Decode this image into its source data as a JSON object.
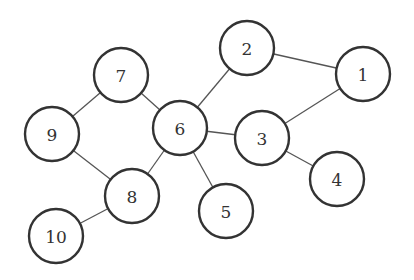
{
  "graph": {
    "node_radius": 27,
    "colors": {
      "stroke": "#333333",
      "edge": "#555555",
      "fill": "#ffffff",
      "background": "#ffffff"
    },
    "nodes": [
      {
        "id": "1",
        "label": "1",
        "x": 363,
        "y": 74
      },
      {
        "id": "2",
        "label": "2",
        "x": 247,
        "y": 48
      },
      {
        "id": "3",
        "label": "3",
        "x": 262,
        "y": 138
      },
      {
        "id": "4",
        "label": "4",
        "x": 337,
        "y": 179
      },
      {
        "id": "5",
        "label": "5",
        "x": 226,
        "y": 211
      },
      {
        "id": "6",
        "label": "6",
        "x": 180,
        "y": 128
      },
      {
        "id": "7",
        "label": "7",
        "x": 121,
        "y": 75
      },
      {
        "id": "8",
        "label": "8",
        "x": 132,
        "y": 196
      },
      {
        "id": "9",
        "label": "9",
        "x": 52,
        "y": 134
      },
      {
        "id": "10",
        "label": "10",
        "x": 56,
        "y": 236
      }
    ],
    "edges": [
      [
        "7",
        "9"
      ],
      [
        "7",
        "6"
      ],
      [
        "6",
        "2"
      ],
      [
        "2",
        "1"
      ],
      [
        "1",
        "3"
      ],
      [
        "6",
        "3"
      ],
      [
        "3",
        "4"
      ],
      [
        "6",
        "8"
      ],
      [
        "6",
        "5"
      ],
      [
        "9",
        "8"
      ],
      [
        "8",
        "10"
      ]
    ]
  }
}
